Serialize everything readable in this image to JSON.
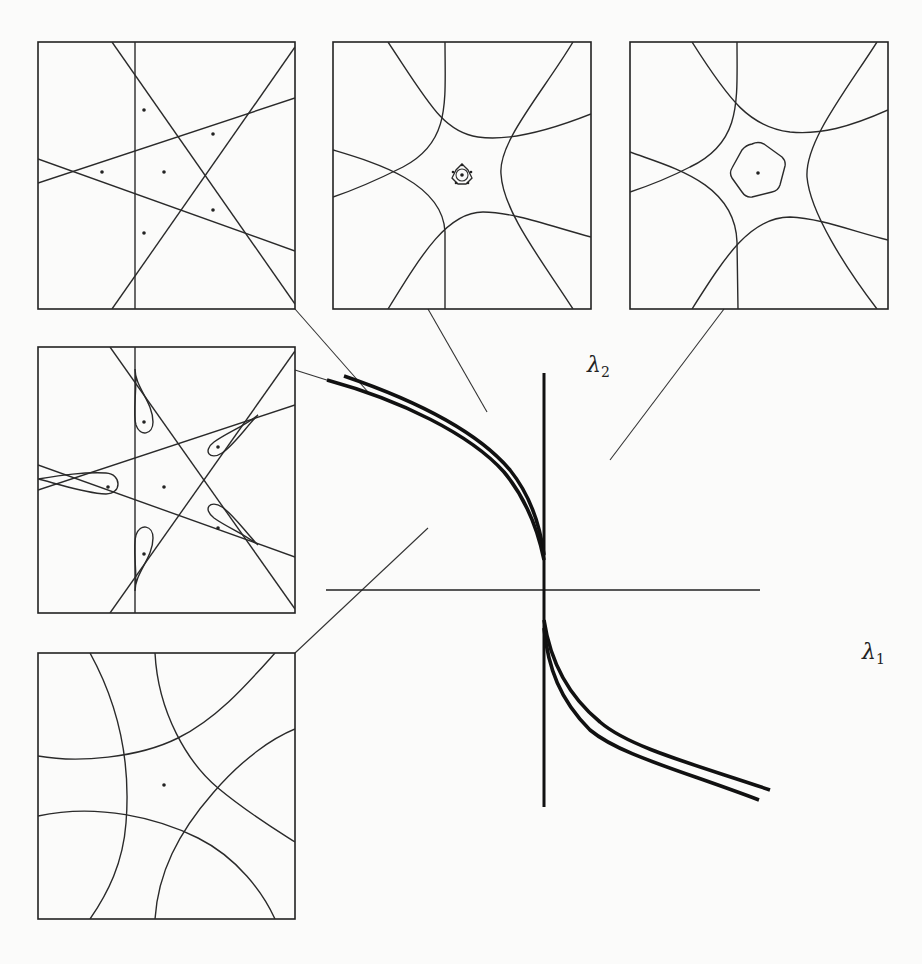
{
  "figure": {
    "axes": {
      "x_label": "λ",
      "x_label_sub": "1",
      "y_label": "λ",
      "y_label_sub": "2"
    },
    "main_curves": [
      {
        "name": "upper-branch-outer",
        "region": "second quadrant to origin"
      },
      {
        "name": "upper-branch-inner",
        "region": "second quadrant to origin"
      },
      {
        "name": "lower-branch-outer",
        "region": "origin to fourth quadrant"
      },
      {
        "name": "lower-branch-inner",
        "region": "origin to fourth quadrant"
      }
    ],
    "panels": [
      {
        "id": "panel-top-left",
        "content": "five straight lines forming a pentagram arrangement with a vertical line; six marked points"
      },
      {
        "id": "panel-top-middle",
        "content": "five hyperbola-like curves around a central small rosette (star-shaped loop) with central point"
      },
      {
        "id": "panel-top-right",
        "content": "five hyperbola-like curves around a rounded pentagon with central point"
      },
      {
        "id": "panel-middle-left",
        "content": "pentagram lines with five teardrop loops each containing a point; central point"
      },
      {
        "id": "panel-bottom-left",
        "content": "five curved arcs forming a curved pentagon around a central point"
      }
    ]
  }
}
